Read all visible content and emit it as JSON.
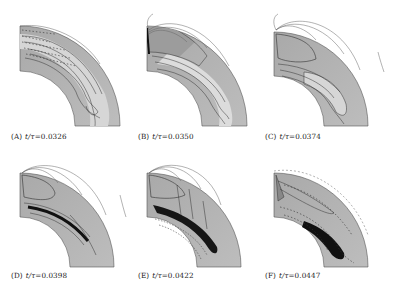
{
  "figure": {
    "layout": "2x3 grid of quarter-annulus contour snapshots",
    "colors": {
      "background": "#ffffff",
      "shell_gray": "#b8b8b8",
      "light_region": "#d8d8d8",
      "dark_region": "#1a1a1a",
      "contour": "#2a2a2a",
      "field_line": "#555555"
    },
    "panels": [
      {
        "id": "A",
        "label": "(A)",
        "var": "t/τ",
        "eq": "=0.0326",
        "caption": "(A) t/τ=0.0326",
        "time": 0.0326
      },
      {
        "id": "B",
        "label": "(B)",
        "var": "t/τ",
        "eq": "=0.0350",
        "caption": "(B) t/τ=0.0350",
        "time": 0.035
      },
      {
        "id": "C",
        "label": "(C)",
        "var": "t/τ",
        "eq": "=0.0374",
        "caption": "(C) t/τ=0.0374",
        "time": 0.0374
      },
      {
        "id": "D",
        "label": "(D)",
        "var": "t/τ",
        "eq": "=0.0398",
        "caption": "(D) t/τ=0.0398",
        "time": 0.0398
      },
      {
        "id": "E",
        "label": "(E)",
        "var": "t/τ",
        "eq": "=0.0422",
        "caption": "(E) t/τ=0.0422",
        "time": 0.0422
      },
      {
        "id": "F",
        "label": "(F)",
        "var": "t/τ",
        "eq": "=0.0447",
        "caption": "(F) t/τ=0.0447",
        "time": 0.0447
      }
    ]
  }
}
